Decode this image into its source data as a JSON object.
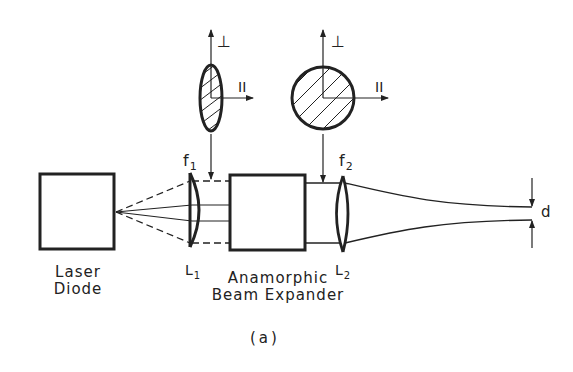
{
  "diagram": {
    "caption": "(a)",
    "components": {
      "laser_diode": {
        "line1": "Laser",
        "line2": "Diode"
      },
      "lens1": {
        "label": "L",
        "subscript": "1",
        "focal_label": "f",
        "focal_subscript": "1"
      },
      "beam_expander": {
        "line1": "Anamorphic",
        "line2": "Beam Expander"
      },
      "lens2": {
        "label": "L",
        "subscript": "2",
        "focal_label": "f",
        "focal_subscript": "2"
      },
      "spot": {
        "label": "d"
      }
    },
    "beam_profiles": [
      {
        "shape": "ellipse",
        "perp_label": "⊥",
        "para_label": "II"
      },
      {
        "shape": "circle",
        "perp_label": "⊥",
        "para_label": "II"
      }
    ],
    "colors": {
      "ink": "#222222",
      "background": "#ffffff"
    }
  }
}
